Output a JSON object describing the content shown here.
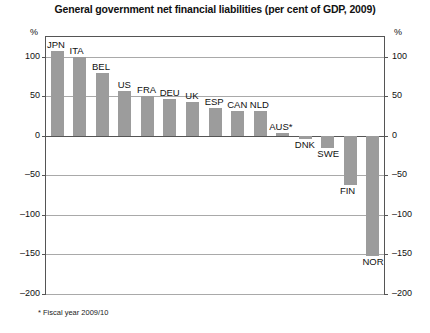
{
  "chart_data": {
    "type": "bar",
    "title": "General government net financial liabilities (per cent of GDP, 2009)",
    "xlabel": "",
    "ylabel": "%",
    "unit_label_left": "%",
    "unit_label_right": "%",
    "ylim": [
      -200,
      125
    ],
    "yticks": [
      100,
      50,
      0,
      -50,
      -100,
      -150,
      -200
    ],
    "ytick_labels_left": [
      "100",
      "50",
      "0",
      "–50",
      "–100",
      "–150",
      "–200"
    ],
    "ytick_labels_right": [
      "100",
      "50",
      "0",
      "–50",
      "–100",
      "–150",
      "–200"
    ],
    "grid": true,
    "legend": "none",
    "categories": [
      "JPN",
      "ITA",
      "BEL",
      "US",
      "FRA",
      "DEU",
      "UK",
      "ESP",
      "CAN",
      "NLD",
      "AUS*",
      "DNK",
      "SWE",
      "FIN",
      "NOR"
    ],
    "values": [
      107,
      100,
      79,
      57,
      50,
      47,
      43,
      35,
      31,
      31,
      3,
      -4,
      -16,
      -62,
      -152
    ],
    "bar_color": "#9c9c9c",
    "footnote": "* Fiscal year 2009/10",
    "annotations": [
      {
        "label": "JPN",
        "value": 107
      },
      {
        "label": "ITA",
        "value": 100
      },
      {
        "label": "BEL",
        "value": 79
      },
      {
        "label": "US",
        "value": 57
      },
      {
        "label": "FRA",
        "value": 50
      },
      {
        "label": "DEU",
        "value": 47
      },
      {
        "label": "UK",
        "value": 43
      },
      {
        "label": "ESP",
        "value": 35
      },
      {
        "label": "CAN",
        "value": 31
      },
      {
        "label": "NLD",
        "value": 31
      },
      {
        "label": "AUS*",
        "value": 3
      },
      {
        "label": "DNK",
        "value": -4
      },
      {
        "label": "SWE",
        "value": -16
      },
      {
        "label": "FIN",
        "value": -62
      },
      {
        "label": "NOR",
        "value": -152
      }
    ]
  }
}
